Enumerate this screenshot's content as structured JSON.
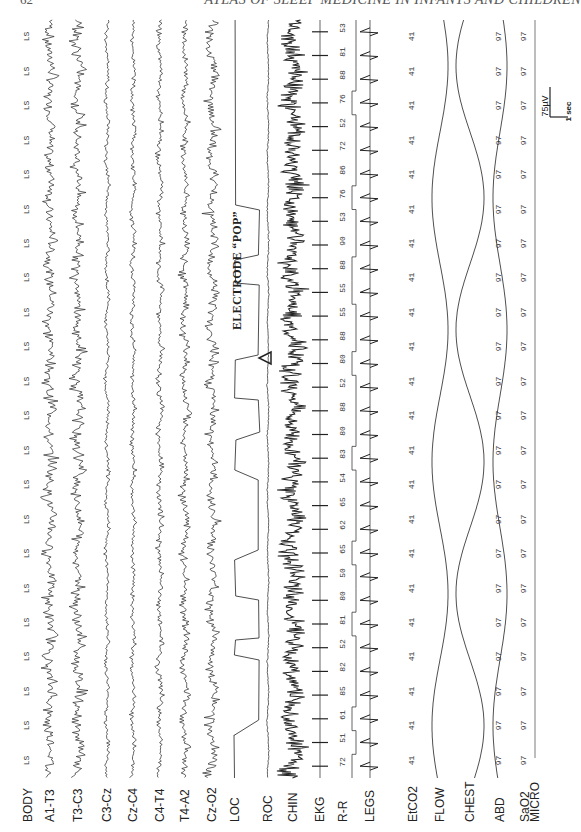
{
  "page": {
    "number": "62",
    "running_title": "ATLAS OF SLEEP MEDICINE IN INFANTS AND CHILDREN"
  },
  "figure": {
    "annotation": "ELECTRODE “POP”",
    "scale_bar": {
      "amplitude": "75µV",
      "time": "1 sec"
    },
    "channels": [
      {
        "label": "BODY",
        "x": 28,
        "kind": "text",
        "value": "LS"
      },
      {
        "label": "A1-T3",
        "x": 50,
        "kind": "eeg",
        "amp": 7,
        "freq": 0.9
      },
      {
        "label": "T3-C3",
        "x": 78,
        "kind": "eeg",
        "amp": 7,
        "freq": 0.9
      },
      {
        "label": "C3-Cz",
        "x": 107,
        "kind": "eeg",
        "amp": 4,
        "freq": 0.5
      },
      {
        "label": "Cz-C4",
        "x": 133,
        "kind": "eeg",
        "amp": 4,
        "freq": 0.6
      },
      {
        "label": "C4-T4",
        "x": 160,
        "kind": "eeg",
        "amp": 5,
        "freq": 0.6
      },
      {
        "label": "T4-A2",
        "x": 185,
        "kind": "eeg",
        "amp": 6,
        "freq": 0.7
      },
      {
        "label": "Cz-O2",
        "x": 212,
        "kind": "eeg",
        "amp": 8,
        "freq": 0.7
      },
      {
        "label": "LOC",
        "x": 235,
        "kind": "square"
      },
      {
        "label": "ROC",
        "x": 268,
        "kind": "eeg",
        "amp": 2,
        "freq": 0.3
      },
      {
        "label": "CHIN",
        "x": 293,
        "kind": "emg",
        "amp": 9
      },
      {
        "label": "EKG",
        "x": 320,
        "kind": "ekg"
      },
      {
        "label": "R-R",
        "x": 343,
        "kind": "rr"
      },
      {
        "label": "LEGS",
        "x": 370,
        "kind": "ekg2"
      },
      {
        "label": "EtCO2",
        "x": 413,
        "kind": "text",
        "value": "41"
      },
      {
        "label": "FLOW",
        "x": 440,
        "kind": "resp",
        "amp": 8
      },
      {
        "label": "CHEST",
        "x": 470,
        "kind": "resp",
        "amp": 14
      },
      {
        "label": "ABD",
        "x": 500,
        "kind": "resp",
        "amp": 7
      },
      {
        "label": "SaO2",
        "x": 525,
        "kind": "text",
        "value": "97"
      },
      {
        "label": "MICRO",
        "x": 535,
        "kind": "flat"
      }
    ],
    "body_position_values": [
      "LS",
      "LS",
      "LS",
      "LS",
      "LS",
      "LS",
      "LS",
      "LS",
      "LS",
      "LS",
      "LS",
      "LS",
      "LS",
      "LS",
      "LS",
      "LS",
      "LS",
      "LS",
      "LS",
      "LS",
      "LS",
      "LS"
    ],
    "etco2_values": [
      "41",
      "41",
      "41",
      "41",
      "41",
      "41",
      "41",
      "41",
      "41",
      "41",
      "41",
      "41",
      "41",
      "41",
      "41",
      "41",
      "41",
      "41",
      "41",
      "41",
      "41",
      "41"
    ],
    "sao2_values": [
      "97",
      "97",
      "97",
      "97",
      "97",
      "97",
      "97",
      "97",
      "97",
      "97",
      "97",
      "97",
      "97",
      "97",
      "97",
      "97",
      "97",
      "97",
      "97",
      "97",
      "97",
      "97"
    ],
    "rr_values": [
      "72",
      "51",
      "61",
      "85",
      "82",
      "52",
      "81",
      "80",
      "50",
      "65",
      "62",
      "65",
      "54",
      "83",
      "80",
      "88",
      "52",
      "80",
      "88",
      "55",
      "55",
      "88",
      "90",
      "53",
      "76",
      "86",
      "72",
      "52",
      "76",
      "88",
      "81",
      "53"
    ]
  }
}
